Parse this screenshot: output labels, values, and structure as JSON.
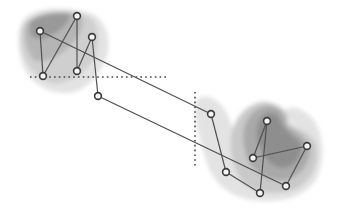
{
  "diagram": {
    "type": "graph-with-regions",
    "colors": {
      "background": "#ffffff",
      "edge": "#505050",
      "node_fill": "#f4f4f4",
      "node_stroke": "#3a3a3a",
      "guide": "#444444",
      "region_levels": [
        "#e6e6e6",
        "#d2d2d2",
        "#bdbdbd",
        "#a6a6a6",
        "#8f8f8f"
      ]
    },
    "nodes": [
      {
        "id": "A",
        "x": 40,
        "y": 31
      },
      {
        "id": "B",
        "x": 77,
        "y": 16
      },
      {
        "id": "C",
        "x": 92,
        "y": 37
      },
      {
        "id": "D",
        "x": 43,
        "y": 76
      },
      {
        "id": "E",
        "x": 77,
        "y": 71
      },
      {
        "id": "F",
        "x": 98,
        "y": 96
      },
      {
        "id": "G",
        "x": 211,
        "y": 114
      },
      {
        "id": "H",
        "x": 267,
        "y": 121
      },
      {
        "id": "I",
        "x": 253,
        "y": 158
      },
      {
        "id": "J",
        "x": 307,
        "y": 146
      },
      {
        "id": "K",
        "x": 226,
        "y": 172
      },
      {
        "id": "L",
        "x": 286,
        "y": 186
      },
      {
        "id": "M",
        "x": 260,
        "y": 193
      }
    ],
    "edges": [
      [
        "A",
        "D"
      ],
      [
        "B",
        "D"
      ],
      [
        "B",
        "E"
      ],
      [
        "C",
        "E"
      ],
      [
        "C",
        "F"
      ],
      [
        "A",
        "G"
      ],
      [
        "F",
        "L"
      ],
      [
        "G",
        "K"
      ],
      [
        "K",
        "M"
      ],
      [
        "M",
        "H"
      ],
      [
        "H",
        "I"
      ],
      [
        "I",
        "J"
      ],
      [
        "J",
        "L"
      ]
    ],
    "guides": [
      {
        "orientation": "horizontal",
        "x1": 30,
        "y1": 77,
        "x2": 168,
        "y2": 77
      },
      {
        "orientation": "vertical",
        "x1": 195,
        "y1": 92,
        "x2": 195,
        "y2": 168
      }
    ]
  }
}
